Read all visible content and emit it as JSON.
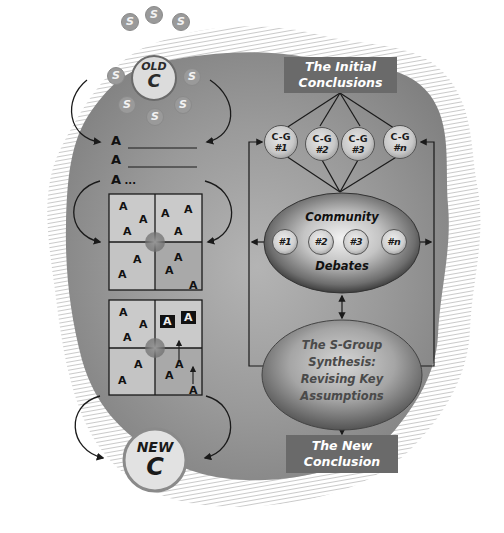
{
  "diagram": {
    "colors": {
      "background_blob": "#8e8e8e",
      "hatch": "#c4c4c4",
      "label_box": "#6a6a6a",
      "label_text": "#ffffff",
      "line": "#1a1a1a",
      "grid_cell_light": "#c9c9c9",
      "grid_cell_dark": "#a9a9a9"
    },
    "left_flow": {
      "old_c": {
        "line1": "OLD",
        "line2": "C",
        "satellites": [
          "S",
          "S",
          "S",
          "S",
          "S",
          "S",
          "S",
          "S"
        ]
      },
      "assumption_list": [
        {
          "letter": "A",
          "suffix": "________"
        },
        {
          "letter": "A",
          "suffix": "________"
        },
        {
          "letter": "A",
          "suffix": " ..."
        }
      ],
      "grid_before": {
        "cells": [
          [
            "A",
            "A",
            "A"
          ],
          [
            "A",
            "A",
            "A"
          ],
          [
            "A",
            "A"
          ],
          [
            "A",
            "A",
            "A"
          ]
        ]
      },
      "grid_after": {
        "cells": [
          [
            "A",
            "A",
            "A"
          ],
          [
            "A",
            "A"
          ],
          [
            "A",
            "A"
          ],
          [
            "A",
            "A",
            "A"
          ]
        ],
        "highlighted": [
          "A",
          "A"
        ]
      },
      "new_c": {
        "line1": "NEW",
        "line2": "C"
      }
    },
    "right_flow": {
      "initial_conclusions": {
        "line1": "The Initial",
        "line2": "Conclusions"
      },
      "conclusion_groups": [
        {
          "top": "C-G",
          "bottom": "#1"
        },
        {
          "top": "C-G",
          "bottom": "#2"
        },
        {
          "top": "C-G",
          "bottom": "#3"
        },
        {
          "top": "C-G",
          "bottom": "#n"
        }
      ],
      "community_debates": {
        "title_top": "Community",
        "title_bottom": "Debates",
        "items": [
          "#1",
          "#2",
          "#3",
          "#n"
        ]
      },
      "synthesis": {
        "line1": "The S-Group",
        "line2": "Synthesis:",
        "line3": "Revising Key",
        "line4": "Assumptions"
      },
      "new_conclusion": {
        "line1": "The New",
        "line2": "Conclusion"
      }
    }
  }
}
